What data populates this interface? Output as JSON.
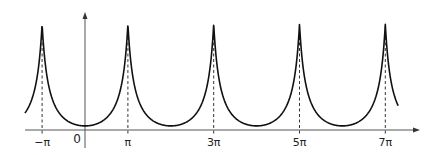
{
  "chart_data": {
    "type": "line",
    "title": "",
    "xlabel": "",
    "ylabel": "",
    "grid": false,
    "legend": null,
    "x_ticks": [
      {
        "value": -1,
        "label": "−π"
      },
      {
        "value": 0,
        "label": "0"
      },
      {
        "value": 1,
        "label": "π"
      },
      {
        "value": 3,
        "label": "3π"
      },
      {
        "value": 5,
        "label": "5π"
      },
      {
        "value": 7,
        "label": "7π"
      }
    ],
    "x_unit": "π",
    "xlim_in_pi": [
      -1.4,
      7.3
    ],
    "peaks_at_pi": [
      -1,
      1,
      3,
      5,
      7
    ],
    "minima_at_pi": [
      0,
      2,
      4,
      6
    ],
    "peak_height_relative": 1.0,
    "minimum_value": 0.02,
    "dashed_lines_at_peaks": true,
    "series": [
      {
        "name": "f(x)",
        "color": "#111111",
        "sample_points_pi": [
          {
            "x": -1.4,
            "y": 0.35
          },
          {
            "x": -1.0,
            "y": 1.0
          },
          {
            "x": -0.5,
            "y": 0.28
          },
          {
            "x": 0.0,
            "y": 0.02
          },
          {
            "x": 0.5,
            "y": 0.28
          },
          {
            "x": 1.0,
            "y": 1.0
          },
          {
            "x": 2.0,
            "y": 0.02
          },
          {
            "x": 3.0,
            "y": 1.0
          },
          {
            "x": 4.0,
            "y": 0.02
          },
          {
            "x": 5.0,
            "y": 1.0
          },
          {
            "x": 6.0,
            "y": 0.02
          },
          {
            "x": 7.0,
            "y": 1.0
          },
          {
            "x": 7.3,
            "y": 0.16
          }
        ]
      }
    ]
  },
  "layout": {
    "origin_px": [
      85,
      130
    ],
    "pi_px": 42.9,
    "peak_top_px": 24,
    "min_px": 128,
    "x_axis_px": [
      25,
      420
    ],
    "y_axis_top_px": 12,
    "y_axis_bottom_px": 148,
    "label_y_px": 146
  }
}
